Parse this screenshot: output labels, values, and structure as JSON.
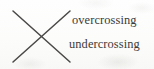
{
  "figure": {
    "kind": "knot-crossing-diagram",
    "width": 154,
    "height": 69,
    "background_color": "#fdfdfc",
    "stroke_color": "#4a4947",
    "text_color": "#3b3a38"
  },
  "labels": {
    "overcrossing": "overcrossing",
    "undercrossing": "undercrossing"
  },
  "strands": {
    "overstrand": {
      "name": "overcrossing-strand",
      "description": "line from lower-left to upper-right, drawn unbroken",
      "x1": 13,
      "y1": 62,
      "x2": 70,
      "y2": 11
    },
    "understrand": {
      "name": "undercrossing-strand",
      "description": "line from upper-left to lower-right",
      "x1": 13,
      "y1": 11,
      "x2": 70,
      "y2": 62
    }
  }
}
